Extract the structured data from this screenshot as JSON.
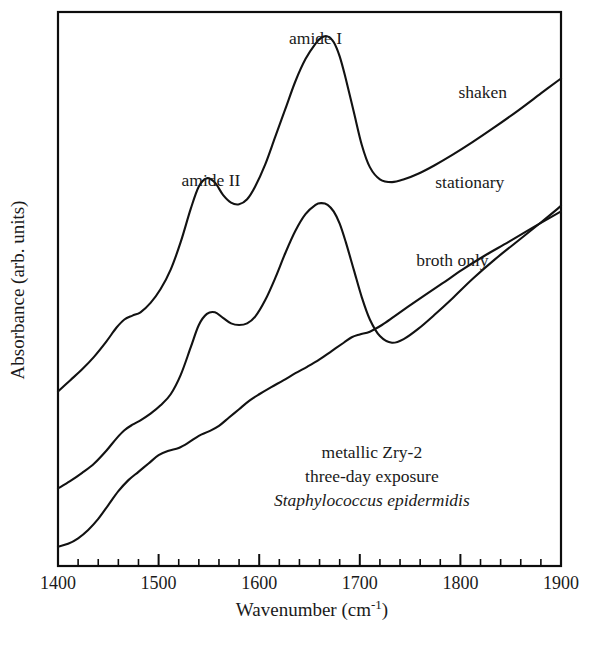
{
  "figure": {
    "background_color": "#ffffff",
    "line_color": "#121212",
    "axis_color": "#0d0d0d"
  },
  "axes": {
    "x_title_main": "Wavenumber (cm",
    "x_title_sup": "-1",
    "x_title_close": ")",
    "y_title": "Absorbance (arb. units)",
    "x_tick_labels": [
      "1400",
      "1500",
      "1600",
      "1700",
      "1800",
      "1900"
    ],
    "x_tick_values": [
      1400,
      1500,
      1600,
      1700,
      1800,
      1900
    ]
  },
  "peak_labels": [
    {
      "text": "amide I",
      "x": 1656,
      "y_px": 44
    },
    {
      "text": "amide II",
      "x": 1552,
      "y_px": 186
    }
  ],
  "curve_labels": [
    {
      "text": "shaken",
      "x": 1798,
      "y_px": 98
    },
    {
      "text": "stationary",
      "x": 1775,
      "y_px": 188
    },
    {
      "text": "broth only",
      "x": 1756,
      "y_px": 266
    }
  ],
  "annotation": {
    "lines": [
      {
        "text": "metallic Zry-2",
        "italic": false
      },
      {
        "text": "three-day exposure",
        "italic": false
      },
      {
        "text": "Staphylococcus epidermidis",
        "italic": true
      }
    ]
  },
  "chart_data": {
    "type": "line",
    "title": "",
    "xlabel": "Wavenumber (cm-1)",
    "ylabel": "Absorbance (arb. units)",
    "xlim": [
      1400,
      1900
    ],
    "ylim": [
      0,
      100
    ],
    "grid": false,
    "legend": "inline-curve-labels",
    "x_major_tick_step": 100,
    "x_minor_tick_step": 20,
    "y_ticks": [],
    "annotations": [
      "amide I",
      "amide II",
      "metallic Zry-2",
      "three-day exposure",
      "Staphylococcus epidermidis"
    ],
    "series": [
      {
        "name": "shaken",
        "offset_note": "top trace, vertically offset for clarity",
        "x": [
          1400,
          1412,
          1424,
          1436,
          1448,
          1458,
          1466,
          1474,
          1482,
          1492,
          1502,
          1512,
          1522,
          1532,
          1540,
          1548,
          1556,
          1564,
          1572,
          1580,
          1588,
          1596,
          1606,
          1616,
          1626,
          1636,
          1646,
          1656,
          1662,
          1668,
          1674,
          1680,
          1686,
          1694,
          1702,
          1710,
          1720,
          1732,
          1744,
          1758,
          1774,
          1792,
          1812,
          1834,
          1858,
          1880,
          1900
        ],
        "y": [
          31.5,
          33.5,
          35.5,
          37.8,
          40.5,
          43.0,
          44.5,
          45.2,
          45.8,
          47.5,
          50.0,
          53.5,
          58.5,
          64.5,
          68.5,
          70.0,
          69.2,
          67.0,
          65.6,
          65.3,
          66.2,
          68.5,
          72.5,
          77.5,
          82.5,
          87.5,
          91.5,
          94.3,
          95.4,
          95.6,
          94.6,
          92.0,
          88.0,
          82.0,
          76.0,
          72.0,
          69.8,
          69.3,
          69.8,
          70.8,
          72.3,
          74.2,
          76.5,
          79.2,
          82.3,
          85.3,
          88.0
        ]
      },
      {
        "name": "stationary",
        "offset_note": "middle trace, vertically offset for clarity",
        "x": [
          1400,
          1412,
          1424,
          1436,
          1448,
          1458,
          1466,
          1474,
          1482,
          1492,
          1502,
          1512,
          1522,
          1532,
          1540,
          1548,
          1556,
          1564,
          1572,
          1580,
          1588,
          1596,
          1606,
          1616,
          1626,
          1636,
          1646,
          1656,
          1662,
          1668,
          1674,
          1680,
          1686,
          1694,
          1702,
          1710,
          1720,
          1732,
          1744,
          1758,
          1774,
          1792,
          1812,
          1834,
          1858,
          1880,
          1900
        ],
        "y": [
          14.0,
          15.3,
          16.8,
          18.5,
          20.8,
          23.0,
          24.5,
          25.5,
          26.3,
          27.5,
          29.0,
          31.0,
          34.5,
          39.5,
          43.5,
          45.5,
          45.8,
          44.8,
          43.8,
          43.5,
          43.8,
          45.0,
          48.0,
          52.0,
          56.5,
          60.5,
          63.5,
          65.2,
          65.5,
          65.2,
          64.0,
          61.8,
          58.5,
          53.5,
          48.5,
          44.5,
          41.5,
          40.3,
          41.0,
          42.8,
          45.3,
          48.3,
          51.8,
          55.3,
          58.8,
          62.0,
          65.0
        ]
      },
      {
        "name": "broth only",
        "offset_note": "bottom trace, vertically offset for clarity",
        "x": [
          1400,
          1410,
          1420,
          1430,
          1440,
          1450,
          1460,
          1470,
          1480,
          1490,
          1500,
          1510,
          1520,
          1530,
          1540,
          1550,
          1560,
          1570,
          1580,
          1590,
          1600,
          1612,
          1624,
          1636,
          1648,
          1660,
          1672,
          1684,
          1692,
          1700,
          1710,
          1722,
          1734,
          1748,
          1764,
          1782,
          1802,
          1824,
          1848,
          1874,
          1900
        ]
      }
    ],
    "broth_only_y": [
      3.5,
      4.0,
      5.0,
      6.5,
      8.5,
      11.0,
      13.5,
      15.5,
      17.0,
      18.5,
      20.0,
      20.8,
      21.3,
      22.3,
      23.5,
      24.3,
      25.3,
      26.8,
      28.3,
      29.8,
      31.0,
      32.3,
      33.5,
      34.8,
      36.0,
      37.3,
      38.8,
      40.3,
      41.3,
      41.8,
      42.3,
      43.5,
      45.0,
      46.8,
      48.8,
      51.0,
      53.5,
      56.0,
      58.5,
      61.3,
      64.0
    ]
  }
}
